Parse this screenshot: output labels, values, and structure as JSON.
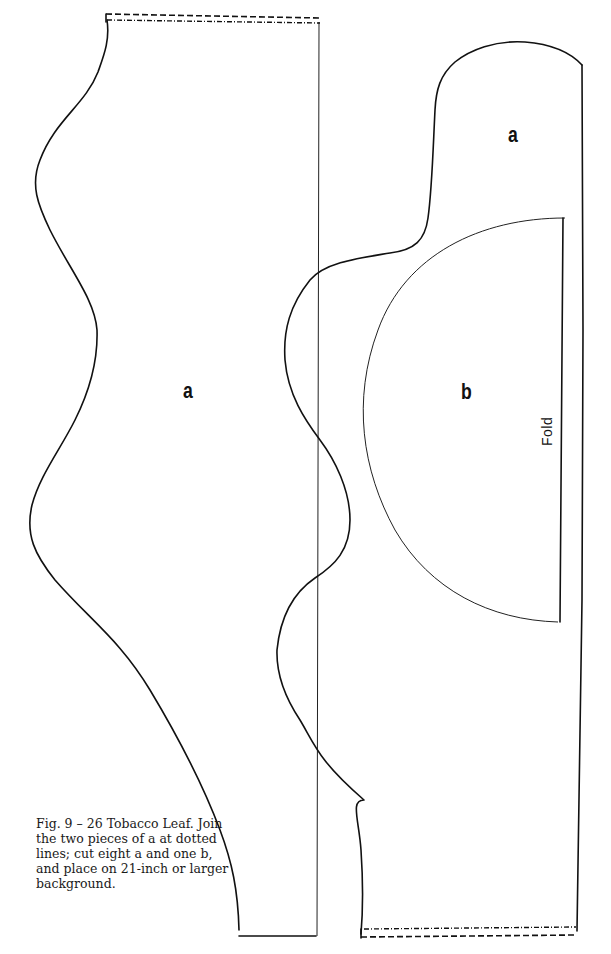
{
  "figure": {
    "labels": {
      "piece_a_lower": "a",
      "piece_a_upper": "a",
      "piece_b": "b",
      "fold": "Fold"
    },
    "caption": "Fig. 9 – 26 Tobacco Leaf. Join the two pieces of a at dotted lines; cut eight a and one b, and place on 21-inch or larger background.",
    "colors": {
      "line": "#111111",
      "background": "#ffffff"
    }
  }
}
